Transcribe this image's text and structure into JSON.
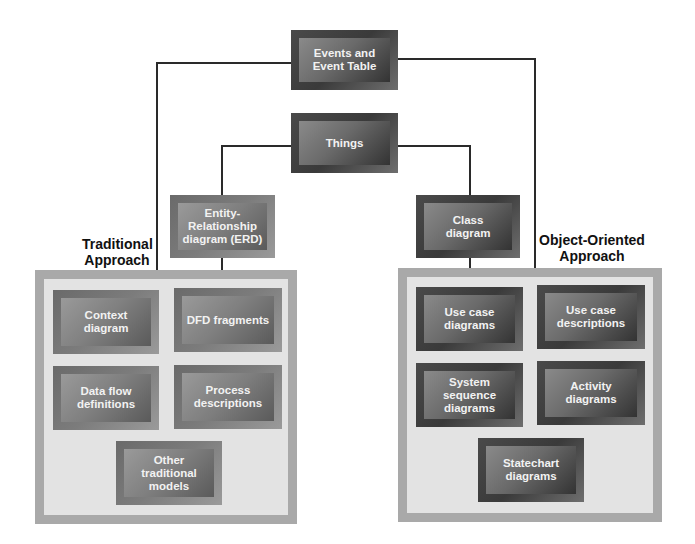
{
  "diagram": {
    "top_nodes": {
      "events": "Events and\nEvent Table",
      "things": "Things"
    },
    "traditional": {
      "label": "Traditional\nApproach",
      "erd": "Entity-\nRelationship\ndiagram (ERD)",
      "models": [
        "Context\ndiagram",
        "DFD fragments",
        "Data flow\ndefinitions",
        "Process\ndescriptions",
        "Other\ntraditional\nmodels"
      ]
    },
    "object_oriented": {
      "label": "Object-Oriented\nApproach",
      "class": "Class\ndiagram",
      "models": [
        "Use case\ndiagrams",
        "Use case\ndescriptions",
        "System\nsequence\ndiagrams",
        "Activity\ndiagrams",
        "Statechart\ndiagrams"
      ]
    },
    "colors": {
      "node_dark": "#3a3a3a",
      "node_mid": "#6a6a6a",
      "container_border": "#a9a9a9",
      "container_fill": "#e3e3e3",
      "connector": "#2a2a2a"
    }
  }
}
